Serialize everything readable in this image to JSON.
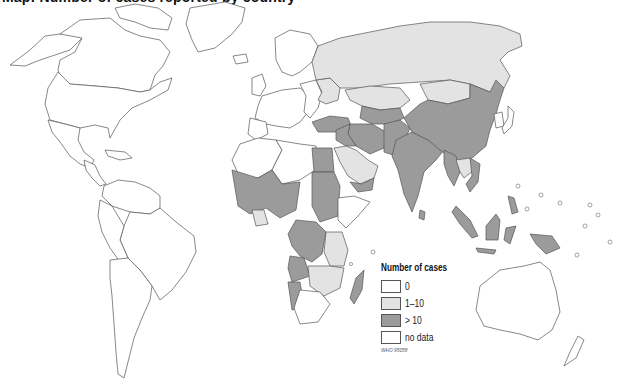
{
  "map": {
    "title_partial": "Map: Number of cases reported by country",
    "projection": "world",
    "fill_colors": {
      "zero": "#ffffff",
      "one_to_ten": "#e3e3e3",
      "over_ten": "#9b9b9b",
      "no_data": "#ffffff"
    },
    "regions": {
      "over_ten": [
        "China",
        "India",
        "Pakistan",
        "Afghanistan",
        "Iran",
        "Iraq",
        "Turkey",
        "Syria",
        "Egypt",
        "Sudan",
        "Yemen",
        "Myanmar",
        "Viet Nam",
        "Indonesia",
        "Malaysia",
        "Philippines",
        "Papua New Guinea",
        "Madagascar",
        "Mali",
        "Niger",
        "Chad",
        "Nigeria",
        "Burkina Faso",
        "Guinea",
        "Senegal",
        "Cameroon",
        "Democratic Republic of the Congo",
        "Angola",
        "Namibia",
        "Turkmenistan",
        "Uzbekistan",
        "Tajikistan",
        "Nepal",
        "Bangladesh",
        "Cambodia"
      ],
      "one_to_ten": [
        "Russian Federation",
        "Kazakhstan",
        "Mongolia",
        "Saudi Arabia",
        "Ukraine",
        "Belarus",
        "Thailand",
        "Laos",
        "United Republic of Tanzania",
        "Zambia",
        "Mozambique",
        "Malawi",
        "Gambia",
        "Ghana",
        "Togo",
        "Benin",
        "Kyrgyzstan"
      ],
      "zero": [
        "United States",
        "Canada",
        "Mexico",
        "Brazil",
        "Argentina",
        "Chile",
        "Australia",
        "Western Europe"
      ],
      "no_data": [
        "Greenland",
        "Antarctica"
      ]
    }
  },
  "legend": {
    "title": "Number of cases",
    "items": [
      {
        "label": "0",
        "color": "#ffffff"
      },
      {
        "label": "1–10",
        "color": "#e3e3e3"
      },
      {
        "label": "> 10",
        "color": "#9b9b9b"
      },
      {
        "label": "no data",
        "color": "#ffffff"
      }
    ],
    "source": "WHO 95058"
  }
}
